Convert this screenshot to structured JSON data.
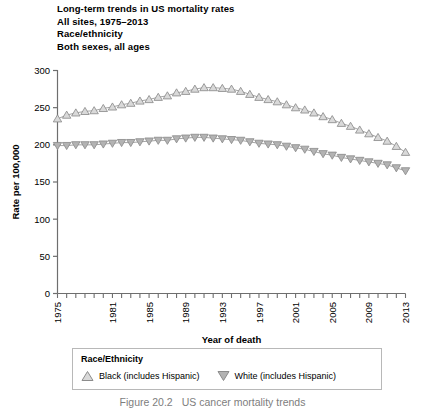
{
  "figure": {
    "title_lines": [
      "Long-term trends in US mortality rates",
      "All sites, 1975–2013",
      "Race/ethnicity",
      "Both sexes, all ages"
    ],
    "caption_number": "Figure 20.2",
    "caption_text": "US cancer mortality trends"
  },
  "legend": {
    "title": "Race/Ethnicity",
    "entries": [
      {
        "marker": "up-triangle-icon",
        "label": "Black (includes Hispanic)",
        "color": "#d9d9d9",
        "stroke": "#8c8c8c"
      },
      {
        "marker": "down-triangle-icon",
        "label": "White (includes Hispanic)",
        "color": "#b3b3b3",
        "stroke": "#8c8c8c"
      }
    ]
  },
  "chart_data": {
    "type": "line",
    "title": "Long-term trends in US mortality rates",
    "xlabel": "Year of death",
    "ylabel": "Rate per 100,000",
    "xlim": [
      1975,
      2013
    ],
    "ylim": [
      0,
      300
    ],
    "yticks": [
      0,
      50,
      100,
      150,
      200,
      250,
      300
    ],
    "xticks_labeled": [
      1975,
      1981,
      1985,
      1989,
      1993,
      1997,
      2001,
      2005,
      2009,
      2013
    ],
    "xticks_all": [
      1975,
      1976,
      1977,
      1978,
      1979,
      1980,
      1981,
      1982,
      1983,
      1984,
      1985,
      1986,
      1987,
      1988,
      1989,
      1990,
      1991,
      1992,
      1993,
      1994,
      1995,
      1996,
      1997,
      1998,
      1999,
      2000,
      2001,
      2002,
      2003,
      2004,
      2005,
      2006,
      2007,
      2008,
      2009,
      2010,
      2011,
      2012,
      2013
    ],
    "grid": false,
    "legend_position": "below",
    "x": [
      1975,
      1976,
      1977,
      1978,
      1979,
      1980,
      1981,
      1982,
      1983,
      1984,
      1985,
      1986,
      1987,
      1988,
      1989,
      1990,
      1991,
      1992,
      1993,
      1994,
      1995,
      1996,
      1997,
      1998,
      1999,
      2000,
      2001,
      2002,
      2003,
      2004,
      2005,
      2006,
      2007,
      2008,
      2009,
      2010,
      2011,
      2012,
      2013
    ],
    "series": [
      {
        "name": "Black (includes Hispanic)",
        "marker": "up-triangle",
        "color": "#d9d9d9",
        "stroke": "#8c8c8c",
        "values": [
          235,
          240,
          243,
          245,
          246,
          249,
          251,
          254,
          256,
          259,
          261,
          264,
          266,
          270,
          272,
          275,
          277,
          277,
          276,
          275,
          272,
          268,
          264,
          261,
          258,
          254,
          250,
          247,
          243,
          238,
          234,
          229,
          225,
          220,
          215,
          210,
          205,
          198,
          190
        ]
      },
      {
        "name": "White (includes Hispanic)",
        "marker": "down-triangle",
        "color": "#b3b3b3",
        "stroke": "#8c8c8c",
        "values": [
          199,
          199,
          200,
          200,
          200,
          201,
          202,
          203,
          203,
          204,
          205,
          206,
          206,
          208,
          209,
          210,
          210,
          209,
          208,
          207,
          206,
          204,
          202,
          201,
          200,
          198,
          196,
          194,
          191,
          188,
          186,
          183,
          181,
          179,
          177,
          175,
          173,
          169,
          165
        ]
      }
    ]
  }
}
